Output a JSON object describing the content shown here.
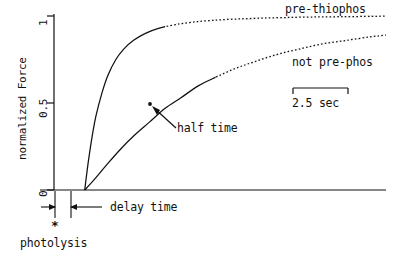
{
  "figure": {
    "background_color": "#ffffff",
    "ink_color": "#111111"
  },
  "axes": {
    "y_title": "normalized Force",
    "y_ticks": [
      "1",
      "0.5",
      "0"
    ],
    "x_title": ""
  },
  "annotations": {
    "curve_upper_label": "pre-thiophos",
    "curve_lower_label": "not pre-phos",
    "half_time_label": "half time",
    "delay_time_label": "delay time",
    "photolysis_label": "photolysis",
    "photolysis_marker": "*",
    "scale_bar_label": "2.5 sec"
  },
  "chart_data": {
    "type": "line",
    "title": "",
    "xlabel": "time",
    "ylabel": "normalized Force",
    "ylim": [
      0,
      1
    ],
    "yticks": [
      0,
      0.5,
      1
    ],
    "ytick_labels": [
      "0",
      "0.5",
      "1"
    ],
    "xlim": [
      0,
      16
    ],
    "grid": false,
    "legend_position": "inline-right-labels",
    "scale_bar": {
      "label": "2.5 sec",
      "value": 2.5,
      "units": "sec"
    },
    "markers": [
      {
        "name": "half time",
        "series": "not pre-phos",
        "x": 5.0,
        "y": 0.5
      },
      {
        "name": "photolysis",
        "x": 0.0,
        "y": 0.0
      },
      {
        "name": "delay time",
        "x_start": 0.0,
        "x_end": 0.72,
        "y": -0.1
      }
    ],
    "series": [
      {
        "name": "pre-thiophos",
        "style": "solid-to-dotted",
        "t_half": 0.72,
        "x": [
          0.72,
          0.9,
          1.1,
          1.3,
          1.6,
          1.9,
          2.3,
          2.7,
          3.2,
          3.8,
          4.5,
          5.3,
          6.2,
          7.2,
          8.3,
          9.5,
          10.8,
          12.2,
          13.7,
          15.3,
          16.0
        ],
        "y": [
          0.0,
          0.16,
          0.31,
          0.43,
          0.56,
          0.66,
          0.75,
          0.81,
          0.86,
          0.9,
          0.93,
          0.95,
          0.965,
          0.975,
          0.982,
          0.987,
          0.991,
          0.994,
          0.996,
          0.998,
          0.999
        ]
      },
      {
        "name": "not pre-phos",
        "style": "solid-to-dotted",
        "t_half": 0.72,
        "x": [
          0.72,
          1.2,
          1.8,
          2.5,
          3.2,
          4.0,
          4.8,
          5.6,
          6.5,
          7.4,
          8.4,
          9.4,
          10.5,
          11.6,
          12.8,
          14.0,
          15.2,
          16.0
        ],
        "y": [
          0.0,
          0.06,
          0.14,
          0.23,
          0.31,
          0.39,
          0.47,
          0.53,
          0.6,
          0.65,
          0.7,
          0.74,
          0.78,
          0.81,
          0.84,
          0.86,
          0.88,
          0.89
        ]
      }
    ]
  }
}
